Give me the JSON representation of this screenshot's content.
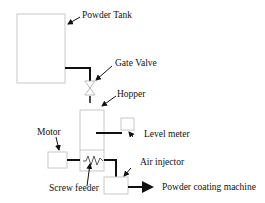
{
  "diagram": {
    "type": "process-flow",
    "labels": {
      "powder_tank": "Powder Tank",
      "gate_valve": "Gate Valve",
      "hopper": "Hopper",
      "level_meter": "Level meter",
      "motor": "Motor",
      "air_injector": "Air injector",
      "screw_feeder": "Screw feeder",
      "powder_coating_machine": "Powder coating machine"
    },
    "colors": {
      "box_stroke": "#c8c8c8",
      "line": "#111111",
      "background": "#ffffff"
    }
  }
}
